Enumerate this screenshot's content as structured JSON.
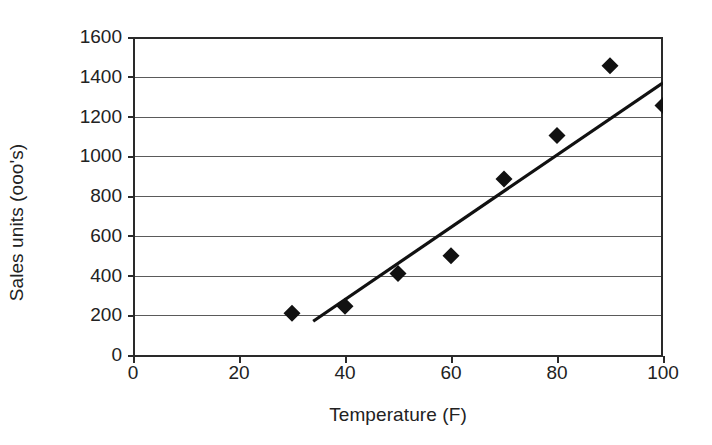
{
  "chart_data": {
    "type": "scatter",
    "title": "",
    "xlabel": "Temperature (F)",
    "ylabel": "Sales units (ooo's)",
    "x": [
      30,
      40,
      50,
      60,
      70,
      80,
      90,
      100
    ],
    "values": [
      210,
      245,
      410,
      500,
      885,
      1105,
      1455,
      1255
    ],
    "series": [
      {
        "name": "Sales vs Temperature",
        "points": [
          {
            "x": 30,
            "y": 210
          },
          {
            "x": 40,
            "y": 245
          },
          {
            "x": 50,
            "y": 410
          },
          {
            "x": 60,
            "y": 500
          },
          {
            "x": 70,
            "y": 885
          },
          {
            "x": 80,
            "y": 1105
          },
          {
            "x": 90,
            "y": 1455
          },
          {
            "x": 100,
            "y": 1255
          }
        ]
      }
    ],
    "trendline": {
      "name": "linear-trendline",
      "x_start": 34,
      "y_start": 170,
      "x_end": 100,
      "y_end": 1370
    },
    "xlim": [
      0,
      100
    ],
    "ylim": [
      0,
      1600
    ],
    "x_ticks": [
      0,
      20,
      40,
      60,
      80,
      100
    ],
    "y_ticks": [
      0,
      200,
      400,
      600,
      800,
      1000,
      1200,
      1400,
      1600
    ],
    "x_tick_labels": [
      "0",
      "20",
      "40",
      "60",
      "80",
      "100"
    ],
    "y_tick_labels": [
      "0",
      "200",
      "400",
      "600",
      "800",
      "1000",
      "1200",
      "1400",
      "1600"
    ],
    "grid": true,
    "grid_axis": "y",
    "legend": false,
    "legend_position": "none",
    "marker": "diamond",
    "marker_color": "#111111",
    "line_color": "#111111",
    "grid_color": "#5a5a5a",
    "background_color": "#ffffff"
  }
}
